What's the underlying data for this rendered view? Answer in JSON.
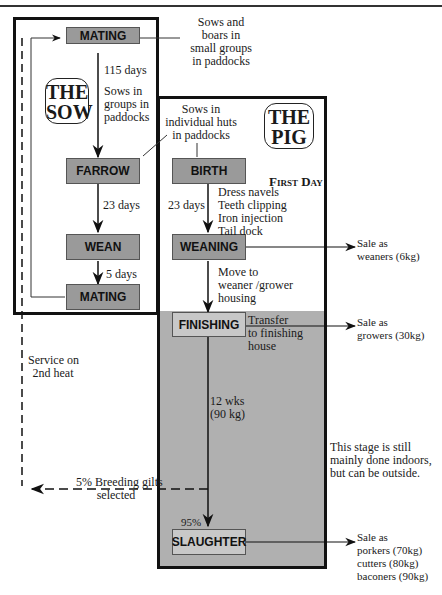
{
  "diagram": {
    "type": "pig-production-flowchart",
    "sections": {
      "sow": {
        "title": "THE\nSOW"
      },
      "pig": {
        "title": "THE\nPIG"
      }
    },
    "nodes": {
      "mating_top": "MATING",
      "farrow": "FARROW",
      "wean": "WEAN",
      "mating_bottom": "MATING",
      "birth": "BIRTH",
      "weaning": "WEANING",
      "finishing": "FINISHING",
      "slaughter": "SLAUGHTER"
    },
    "annotations": {
      "sows_boars": "Sows and\nboars in\nsmall groups\nin paddocks",
      "days_115": "115 days",
      "sows_groups": "Sows in\ngroups in\npaddocks",
      "sows_huts": "Sows in\nindividual huts\nin paddocks",
      "first_day": "First Day",
      "first_day_tasks": "Dress navels\nTeeth clipping\nIron injection\nTail dock",
      "sow_23_days": "23 days",
      "pig_23_days": "23 days",
      "days_5": "5 days",
      "move_to": "Move to\nweaner /grower\nhousing",
      "transfer": "Transfer\nto finishing\nhouse",
      "service": "Service on\n2nd heat",
      "wks_12": "12 wks\n(90 kg)",
      "indoors_note": "This stage is still\nmainly done indoors,\nbut can be outside.",
      "breeding_gilts": "5% Breeding gilts\nselected",
      "pct_95": "95%"
    },
    "sales": {
      "weaners": "Sale as\nweaners (6kg)",
      "growers": "Sale as\ngrowers (30kg)",
      "slaughter": "Sale as\nporkers (70kg)\ncutters (80kg)\nbaconers (90kg)"
    },
    "colors": {
      "node_fill": "#9a9a9a",
      "finishing_fill": "#c8c8c8",
      "shade_region": "#b0b0b0",
      "line": "#111111"
    }
  }
}
